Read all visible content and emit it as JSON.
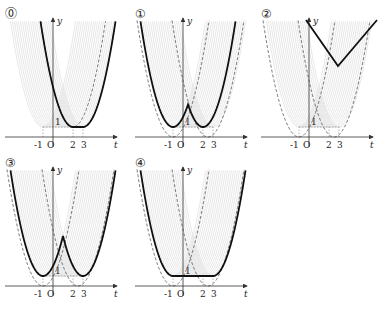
{
  "figure": {
    "panels": [
      {
        "id": "0",
        "label": "⓪",
        "x0": 53,
        "y0": 137,
        "curve": "flat_min"
      },
      {
        "id": "1",
        "label": "①",
        "x0": 183,
        "y0": 137,
        "curve": "w_shape"
      },
      {
        "id": "2",
        "label": "②",
        "x0": 309,
        "y0": 137,
        "curve": "v_only"
      },
      {
        "id": "3",
        "label": "③",
        "x0": 53,
        "y0": 286,
        "curve": "w_shape_wide"
      },
      {
        "id": "4",
        "label": "④",
        "x0": 183,
        "y0": 286,
        "curve": "trough_flat"
      }
    ],
    "axis": {
      "x_label": "t",
      "y_label": "y",
      "origin_label": "O",
      "ticks": [
        "-1",
        "2",
        "3"
      ],
      "level_label": "1"
    },
    "scale_px_per_unit": 10,
    "colors": {
      "curve": "#111111",
      "dashed": "#555555",
      "hatch": "#d6d6d6",
      "axis": "#333333"
    }
  },
  "chart_data": {
    "type": "line",
    "title": "",
    "xlabel": "t",
    "ylabel": "y",
    "x_ticks": [
      -1,
      2,
      3
    ],
    "y_ticks": [
      1
    ],
    "panels": [
      {
        "label": "⓪",
        "description": "y=(t-2)^2+1 for t<2, y=1 for 2≤t≤3, y=(t-3)^2+1 for t>3"
      },
      {
        "label": "①",
        "description": "W-shape: minima at t=-1 and t=2 (y=1), local max near t=0.5"
      },
      {
        "label": "②",
        "description": "V-shape above region with min near t=0.5, y≈7"
      },
      {
        "label": "③",
        "description": "W-shape: minima at t=-1 and t=3 (y=1), local max near t=1"
      },
      {
        "label": "④",
        "description": "flat min y=1 on [-1,3], parabolic branches outside"
      }
    ]
  }
}
